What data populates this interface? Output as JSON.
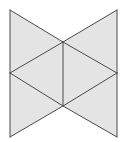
{
  "figure": {
    "type": "geometric-net",
    "colors": {
      "fill": "#e4e4e4",
      "stroke": "#4a4a4a",
      "background": "#ffffff"
    },
    "vertices": {
      "top_left": [
        10,
        10
      ],
      "top_right": [
        117,
        10
      ],
      "center_top": [
        63,
        42
      ],
      "mid_left": [
        10,
        73
      ],
      "mid_right": [
        117,
        73
      ],
      "center_bottom": [
        63,
        106
      ],
      "bottom_left": [
        10,
        137
      ],
      "bottom_right": [
        117,
        137
      ]
    },
    "faces": [
      [
        "top_left",
        "center_top",
        "mid_left"
      ],
      [
        "top_right",
        "mid_right",
        "center_top"
      ],
      [
        "mid_left",
        "center_top",
        "center_bottom"
      ],
      [
        "center_top",
        "mid_right",
        "center_bottom"
      ],
      [
        "mid_left",
        "center_bottom",
        "bottom_left"
      ],
      [
        "center_bottom",
        "mid_right",
        "bottom_right"
      ]
    ],
    "edges": [
      [
        "top_left",
        "mid_left"
      ],
      [
        "mid_left",
        "bottom_left"
      ],
      [
        "top_right",
        "mid_right"
      ],
      [
        "mid_right",
        "bottom_right"
      ],
      [
        "top_left",
        "center_top"
      ],
      [
        "center_top",
        "mid_right"
      ],
      [
        "top_right",
        "center_top"
      ],
      [
        "center_top",
        "mid_left"
      ],
      [
        "mid_left",
        "center_bottom"
      ],
      [
        "center_bottom",
        "bottom_right"
      ],
      [
        "mid_right",
        "center_bottom"
      ],
      [
        "center_bottom",
        "bottom_left"
      ],
      [
        "center_top",
        "center_bottom"
      ]
    ]
  }
}
